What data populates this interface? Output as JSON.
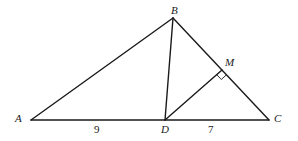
{
  "diagram": {
    "points": {
      "A": {
        "label": "A",
        "x": 31,
        "y": 120
      },
      "B": {
        "label": "B",
        "x": 173,
        "y": 18
      },
      "C": {
        "label": "C",
        "x": 269,
        "y": 120
      },
      "D": {
        "label": "D",
        "x": 165,
        "y": 120
      },
      "M": {
        "label": "M",
        "x": 222,
        "y": 70
      }
    },
    "segments": [
      "AB",
      "BC",
      "AC",
      "BD",
      "DM"
    ],
    "lengths": {
      "AD": "9",
      "DC": "7"
    },
    "right_angle_at": "M"
  }
}
